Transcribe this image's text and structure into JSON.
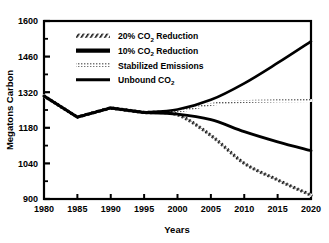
{
  "chart_data": {
    "type": "line",
    "title": "",
    "xlabel": "Years",
    "ylabel": "Megatons Carbon",
    "xlim": [
      1980,
      2020
    ],
    "ylim": [
      900,
      1600
    ],
    "xticks": [
      1980,
      1985,
      1990,
      1995,
      2000,
      2005,
      2010,
      2015,
      2020
    ],
    "yticks": [
      900,
      1040,
      1180,
      1320,
      1460,
      1600
    ],
    "yticks_minor": [
      970,
      1110,
      1250,
      1390,
      1530
    ],
    "grid": false,
    "legend_position": "upper-left-inside",
    "x": [
      1980,
      1985,
      1990,
      1995,
      2000,
      2005,
      2010,
      2015,
      2020
    ],
    "series": [
      {
        "name": "20% CO2 Reduction",
        "name_prefix": "20% CO",
        "name_sub": "2",
        "name_suffix": " Reduction",
        "style": "hatched",
        "color": "#111111",
        "values": [
          1305,
          1222,
          1258,
          1240,
          1232,
          1150,
          1040,
          975,
          915
        ]
      },
      {
        "name": "10% CO2 Reduction",
        "name_prefix": "10% CO",
        "name_sub": "2",
        "name_suffix": " Reduction",
        "style": "thick-solid",
        "color": "#000000",
        "values": [
          1305,
          1222,
          1258,
          1240,
          1234,
          1212,
          1165,
          1125,
          1090
        ]
      },
      {
        "name": "Stabilized Emissions",
        "name_prefix": "Stabilized Emissions",
        "name_sub": "",
        "name_suffix": "",
        "style": "fine-dotted",
        "color": "#7a7a7a",
        "values": [
          1305,
          1222,
          1258,
          1240,
          1245,
          1272,
          1283,
          1286,
          1287
        ]
      },
      {
        "name": "Unbound CO2",
        "name_prefix": "Unbound CO",
        "name_sub": "2",
        "name_suffix": "",
        "style": "solid",
        "color": "#000000",
        "values": [
          1305,
          1222,
          1258,
          1240,
          1252,
          1290,
          1355,
          1435,
          1520
        ]
      }
    ]
  },
  "axes": {
    "y_label": "Megatons Carbon",
    "x_label": "Years",
    "y_tick_labels": [
      "1600",
      "1460",
      "1320",
      "1180",
      "1040",
      "900"
    ],
    "x_tick_labels": [
      "1980",
      "1985",
      "1990",
      "1995",
      "2000",
      "2005",
      "2010",
      "2015",
      "2020"
    ]
  },
  "legend": {
    "entries": [
      {
        "label": "20% CO",
        "sub": "2",
        "tail": " Reduction",
        "swatch": "hatched"
      },
      {
        "label": "10% CO",
        "sub": "2",
        "tail": " Reduction",
        "swatch": "thick-solid"
      },
      {
        "label": "Stabilized Emissions",
        "sub": "",
        "tail": "",
        "swatch": "fine-dotted"
      },
      {
        "label": "Unbound CO",
        "sub": "2",
        "tail": "",
        "swatch": "solid"
      }
    ]
  }
}
